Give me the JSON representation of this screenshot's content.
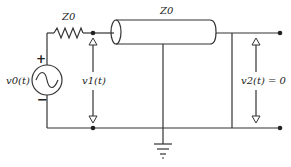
{
  "diagram": {
    "title": "",
    "source": {
      "label": "v0(t)",
      "plus": "+",
      "minus": "−"
    },
    "source_impedance": {
      "label": "Z0"
    },
    "line": {
      "label": "Z0"
    },
    "input_voltage": {
      "label": "v1(t)"
    },
    "output_voltage": {
      "label": "v2(t) = 0"
    }
  }
}
